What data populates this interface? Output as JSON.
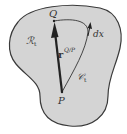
{
  "diagram": {
    "region_label": "ℛ",
    "region_sub": "t",
    "point_q": "Q",
    "point_p": "P",
    "vector_label": "r",
    "vector_sup": "Q/P",
    "curve_label": "𝒞",
    "curve_sub": "t",
    "element_label": "dx",
    "colors": {
      "region_fill": "#d4d4d4",
      "outline": "#3a3a3a",
      "background": "#ffffff"
    }
  }
}
